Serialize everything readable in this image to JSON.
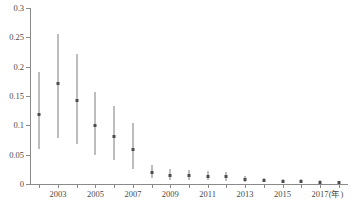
{
  "chart_data": {
    "type": "scatter",
    "title": "",
    "subtitle": "",
    "xlabel": "(年)",
    "ylabel": "",
    "xlim": [
      2001.5,
      2018.5
    ],
    "ylim": [
      0,
      0.3
    ],
    "grid": false,
    "legend": null,
    "yticks": [
      0,
      0.05,
      0.1,
      0.15,
      0.2,
      0.25,
      0.3
    ],
    "ytick_labels": [
      "0",
      "0.05",
      "0.1",
      "0.15",
      "0.2",
      "0.25",
      "0.3"
    ],
    "xticks": [
      2002,
      2003,
      2004,
      2005,
      2006,
      2007,
      2008,
      2009,
      2010,
      2011,
      2012,
      2013,
      2014,
      2015,
      2016,
      2017,
      2018
    ],
    "xtick_labels": [
      "2003",
      "2005",
      "2007",
      "2009",
      "2011",
      "2013",
      "2015",
      "2017"
    ],
    "xtick_labeled_years": [
      2003,
      2005,
      2007,
      2009,
      2011,
      2013,
      2015,
      2017
    ],
    "x": [
      2002,
      2003,
      2004,
      2005,
      2006,
      2007,
      2008,
      2009,
      2010,
      2011,
      2012,
      2013,
      2014,
      2015,
      2016,
      2017,
      2018
    ],
    "values": [
      0.119,
      0.171,
      0.143,
      0.099,
      0.081,
      0.058,
      0.02,
      0.015,
      0.014,
      0.013,
      0.012,
      0.007,
      0.006,
      0.005,
      0.004,
      0.003,
      0.002
    ],
    "error_low": [
      0.06,
      0.078,
      0.069,
      0.05,
      0.041,
      0.025,
      0.01,
      0.007,
      0.007,
      0.006,
      0.005,
      0.003,
      0.003,
      0.002,
      0.002,
      0.001,
      0.001
    ],
    "error_high": [
      0.191,
      0.255,
      0.222,
      0.157,
      0.133,
      0.104,
      0.032,
      0.025,
      0.024,
      0.022,
      0.021,
      0.013,
      0.011,
      0.009,
      0.008,
      0.006,
      0.005
    ],
    "marker": "square",
    "marker_color": "#4d4d4d",
    "errorbar_color": "#7d7d7d",
    "axis_color": "#8a8a8a",
    "background": "#ffffff"
  },
  "caption": {
    "text": ""
  }
}
